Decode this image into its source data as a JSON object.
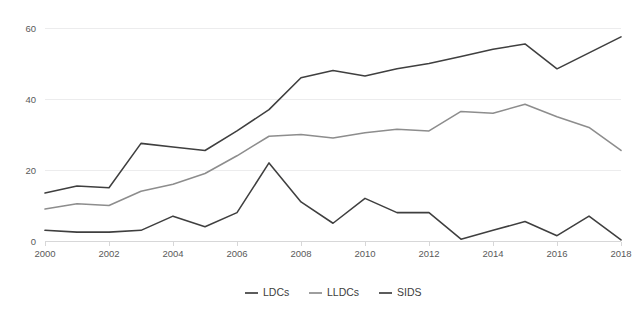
{
  "chart_data": {
    "type": "line",
    "title": "",
    "subtitle": "",
    "xlabel": "",
    "ylabel": "",
    "x": [
      2000,
      2001,
      2002,
      2003,
      2004,
      2005,
      2006,
      2007,
      2008,
      2009,
      2010,
      2011,
      2012,
      2013,
      2014,
      2015,
      2016,
      2017,
      2018
    ],
    "xlim": [
      2000,
      2018
    ],
    "ylim": [
      0,
      60
    ],
    "y_ticks": [
      0,
      20,
      40,
      60
    ],
    "y_tick_labels": [
      "0",
      "20",
      "40",
      "60"
    ],
    "x_tick_values": [
      2000,
      2002,
      2004,
      2006,
      2008,
      2010,
      2012,
      2014,
      2016,
      2018
    ],
    "x_tick_labels": [
      "2000",
      "2002",
      "2004",
      "2006",
      "2008",
      "2010",
      "2012",
      "2014",
      "2016",
      "2018"
    ],
    "grid": true,
    "grid_axis": "y",
    "legend": true,
    "legend_position": "bottom-center",
    "series": [
      {
        "name": "LDCs",
        "color": "#3f3f3f",
        "values": [
          13.5,
          15.5,
          15.0,
          27.5,
          26.5,
          25.5,
          31.0,
          37.0,
          46.0,
          48.0,
          46.5,
          48.5,
          50.0,
          52.0,
          54.0,
          55.5,
          48.5,
          53.0,
          57.5
        ]
      },
      {
        "name": "LLDCs",
        "color": "#8d8d8d",
        "values": [
          9.0,
          10.5,
          10.0,
          14.0,
          16.0,
          19.0,
          24.0,
          29.5,
          30.0,
          29.0,
          30.5,
          31.5,
          31.0,
          36.5,
          36.0,
          38.5,
          35.0,
          32.0,
          25.5
        ]
      },
      {
        "name": "SIDS",
        "color": "#3f3f3f",
        "values": [
          3.0,
          2.5,
          2.5,
          3.0,
          7.0,
          4.0,
          8.0,
          22.0,
          11.0,
          5.0,
          12.0,
          8.0,
          8.0,
          0.5,
          3.0,
          5.5,
          1.5,
          7.0,
          0.3
        ]
      }
    ]
  },
  "legend": {
    "items": [
      {
        "label": "LDCs",
        "color": "#3f3f3f"
      },
      {
        "label": "LLDCs",
        "color": "#8d8d8d"
      },
      {
        "label": "SIDS",
        "color": "#3f3f3f"
      }
    ]
  },
  "axes": {
    "y_labels": [
      "60",
      "40",
      "20",
      "0"
    ],
    "x_labels": [
      "2000",
      "2002",
      "2004",
      "2006",
      "2008",
      "2010",
      "2012",
      "2014",
      "2016",
      "2018"
    ]
  },
  "colors": {
    "background": "#ffffff",
    "grid": "#ececed",
    "axis": "#d7d7d8",
    "tick_text": "#5a5a5a",
    "legend_text": "#404040",
    "dark_series": "#3f3f3f",
    "light_series": "#8d8d8d"
  }
}
